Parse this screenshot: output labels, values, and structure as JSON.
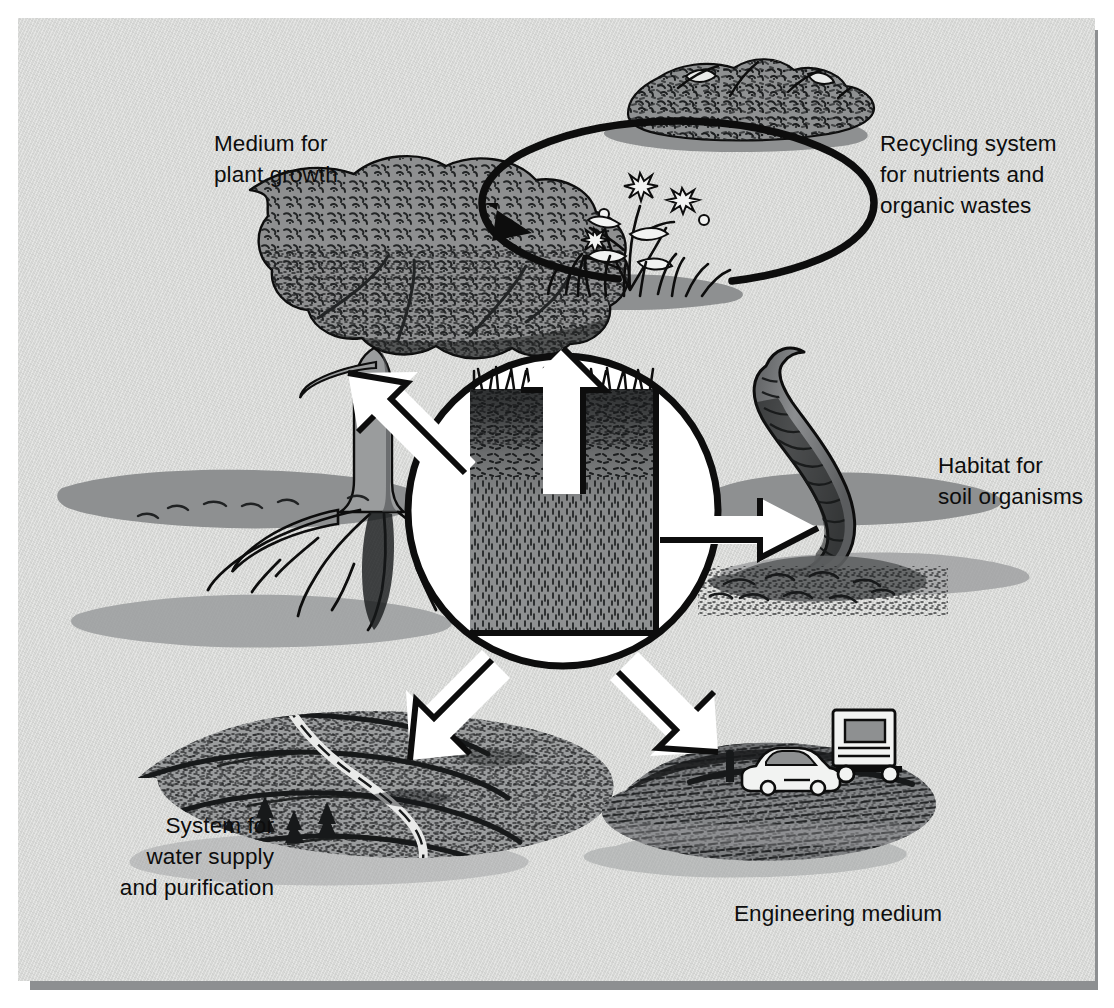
{
  "figure": {
    "background_color": "#d7d8d6",
    "ink_color": "#0d0d0d",
    "mid_gray": "#8e9091",
    "dark_gray": "#6e7072",
    "arrow_fill": "#ffffff"
  },
  "center": {
    "name": "soil-profile",
    "circle_fill": "#ffffff",
    "circle_stroke": "#0d0d0d",
    "profile": {
      "surface": "grass",
      "topsoil_color": "#3a3c3d",
      "subsoil_color": "#8e9091"
    }
  },
  "callouts": [
    {
      "id": "plant-growth",
      "label": "Medium for\nplant growth",
      "position": "top-left",
      "illustration": "broadleaf-tree-with-roots",
      "arrow": "up-left"
    },
    {
      "id": "recycling",
      "label": "Recycling system\nfor nutrients and\norganic wastes",
      "position": "top-right",
      "illustration": "flowering-plant-and-compost-pile-with-cycle-arrow",
      "arrow": "up"
    },
    {
      "id": "habitat",
      "label": "Habitat for\nsoil organisms",
      "position": "right",
      "illustration": "earthworm-emerging-from-soil",
      "arrow": "right"
    },
    {
      "id": "water",
      "label": "System for\nwater supply\nand purification",
      "position": "bottom-left",
      "illustration": "terraced-hillside-with-stream",
      "arrow": "down-left"
    },
    {
      "id": "engineering",
      "label": "Engineering medium",
      "position": "bottom-right",
      "illustration": "compacted-roadbed-with-car-and-truck",
      "arrow": "down-right"
    }
  ]
}
